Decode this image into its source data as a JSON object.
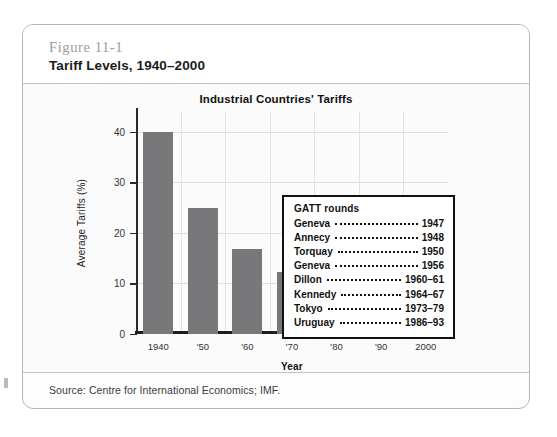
{
  "figure": {
    "number": "Figure 11-1",
    "title": "Tariff Levels, 1940–2000",
    "source": "Source: Centre for International Economics; IMF."
  },
  "legend": {
    "heading": "GATT rounds",
    "rows": [
      {
        "name": "Geneva",
        "year": "1947"
      },
      {
        "name": "Annecy",
        "year": "1948"
      },
      {
        "name": "Torquay",
        "year": "1950"
      },
      {
        "name": "Geneva",
        "year": "1956"
      },
      {
        "name": "Dillon",
        "year": "1960–61"
      },
      {
        "name": "Kennedy",
        "year": "1964–67"
      },
      {
        "name": "Tokyo",
        "year": "1973–79"
      },
      {
        "name": "Uruguay",
        "year": "1986–93"
      }
    ]
  },
  "colors": {
    "bar": "#78787a",
    "grid": "#dededd",
    "axis": "#1d1d1d",
    "fig_number": "#9b9b9b"
  },
  "chart_data": {
    "type": "bar",
    "title": "Industrial Countries' Tariffs",
    "xlabel": "Year",
    "ylabel": "Average Tariffs (%)",
    "categories": [
      "1940",
      "'50",
      "'60",
      "'70",
      "'80",
      "'90",
      "2000"
    ],
    "values": [
      40,
      25,
      16.7,
      12.3,
      9,
      5.5,
      3
    ],
    "ylim": [
      0,
      44
    ],
    "yticks": [
      0,
      10,
      20,
      30,
      40
    ],
    "ytick_labels": [
      "0",
      "10",
      "20",
      "30",
      "40"
    ],
    "grid": true,
    "legend_position": "inside-top-right",
    "series": [
      {
        "name": "Average Tariffs (%)",
        "values": [
          40,
          25,
          16.7,
          12.3,
          9,
          5.5,
          3
        ]
      }
    ]
  }
}
